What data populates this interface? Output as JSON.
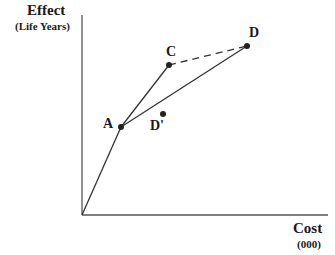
{
  "diagram": {
    "y_axis": {
      "title": "Effect",
      "subtitle": "(Life Years)"
    },
    "x_axis": {
      "title": "Cost",
      "subtitle": "(000)"
    },
    "points": {
      "A": {
        "label": "A"
      },
      "C": {
        "label": "C"
      },
      "D": {
        "label": "D"
      },
      "Dprime": {
        "label": "D'"
      }
    },
    "colors": {
      "line": "#333333",
      "text": "#1a1a1a"
    }
  }
}
